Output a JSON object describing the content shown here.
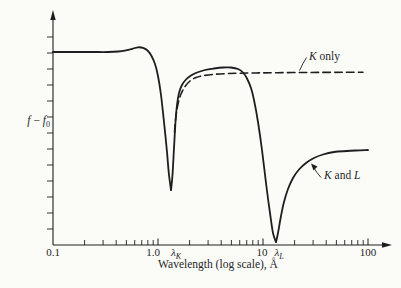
{
  "figure": {
    "background": "#fbfbf8",
    "line_color": "#1e1e1e",
    "text_color": "#262626"
  },
  "labels": {
    "y": {
      "f1": "f",
      "minus": " − ",
      "f2": "f",
      "sub": "0"
    },
    "lambda_k": {
      "main": "λ",
      "sub": "K"
    },
    "lambda_l": {
      "main": "λ",
      "sub": "L"
    }
  },
  "annotations": {
    "k_only": {
      "var": "K",
      "rest": " only"
    },
    "k_and_l": {
      "var1": "K",
      "mid": " and ",
      "var2": "L"
    }
  },
  "chart_data": {
    "type": "line",
    "title": "",
    "xlabel": "Wavelength (log scale), Å",
    "ylabel": "f − f₀",
    "x_scale": "log",
    "x_range_angstrom": [
      0.1,
      100
    ],
    "x_tick_labels": [
      "0.1",
      "1.0",
      "10",
      "100"
    ],
    "edge_labels": [
      "λK",
      "λL"
    ],
    "y_axis_numeric_labels": false,
    "grid": false,
    "legend_position": "inline-annotations",
    "coordinate_space": "svg_px (y-axis qualitative; x calibration: 0.1 Å at x0 px, decade_px per decade)",
    "axes": {
      "origin": [
        53,
        245
      ],
      "y_top": 18,
      "x_right": 384,
      "y_ticks": {
        "start": 37,
        "step": 16,
        "count": 13,
        "len": 6
      },
      "x_log": {
        "x0": 53,
        "decade_px": 105,
        "decades": 3,
        "minor_len": 5,
        "major_len": 6.5
      }
    },
    "series": [
      {
        "name": "K and L",
        "style": "solid",
        "width": 1.8,
        "segments": [
          [
            [
              53,
              52
            ],
            [
              72,
              52
            ],
            [
              92,
              52
            ],
            [
              108,
              52
            ],
            [
              118,
              51.5
            ],
            [
              126,
              50.3
            ],
            [
              133,
              48.6
            ],
            [
              138,
              47.3
            ],
            [
              143,
              47.8
            ],
            [
              147,
              50
            ],
            [
              151,
              55
            ],
            [
              155,
              64
            ],
            [
              158,
              76
            ],
            [
              161,
              95
            ],
            [
              164,
              122
            ],
            [
              167,
              152
            ],
            [
              169,
              175
            ],
            [
              171,
              190
            ]
          ],
          [
            [
              171,
              190
            ],
            [
              172.5,
              175
            ],
            [
              174,
              148
            ],
            [
              175.5,
              122
            ],
            [
              177,
              105
            ],
            [
              179,
              93
            ],
            [
              182,
              85
            ],
            [
              186,
              79.5
            ],
            [
              191,
              75.5
            ],
            [
              197,
              72.5
            ],
            [
              205,
              70
            ],
            [
              214,
              68.5
            ],
            [
              223,
              67.5
            ],
            [
              231,
              67.5
            ],
            [
              238,
              69
            ],
            [
              243,
              72.5
            ],
            [
              247,
              78.5
            ],
            [
              251,
              88
            ],
            [
              254,
              100
            ],
            [
              258,
              122
            ],
            [
              262,
              150
            ],
            [
              266,
              183
            ],
            [
              270,
              213
            ],
            [
              273,
              233
            ],
            [
              276,
              242
            ]
          ],
          [
            [
              276,
              242
            ],
            [
              278,
              233
            ],
            [
              281,
              216
            ],
            [
              284,
              202
            ],
            [
              288,
              189
            ],
            [
              293,
              178
            ],
            [
              299,
              169.5
            ],
            [
              306,
              163
            ],
            [
              314,
              158
            ],
            [
              323,
              154.5
            ],
            [
              334,
              152
            ],
            [
              347,
              151
            ],
            [
              360,
              150.3
            ],
            [
              368,
              150
            ]
          ]
        ]
      },
      {
        "name": "K only",
        "style": "dashed",
        "width": 1.6,
        "dash": "7.5 4.3",
        "segments": [
          [
            [
              174.5,
              132
            ],
            [
              176,
              116
            ],
            [
              178,
              104
            ],
            [
              181,
              94
            ],
            [
              185,
              86.5
            ],
            [
              190,
              81
            ],
            [
              196,
              77.5
            ],
            [
              204,
              75.5
            ],
            [
              214,
              74.3
            ],
            [
              226,
              73.6
            ],
            [
              240,
              73.2
            ],
            [
              258,
              72.9
            ],
            [
              278,
              72.7
            ],
            [
              300,
              72.5
            ],
            [
              322,
              72.4
            ],
            [
              344,
              72.3
            ],
            [
              363,
              72.2
            ]
          ]
        ]
      }
    ],
    "leaders": [
      {
        "name": "k-only-leader",
        "path": "M299.5,70.5 Q303,63 306.5,57.5"
      },
      {
        "name": "k-and-l-leader",
        "path": "M313,166.5 Q316.5,172.5 321,177.5",
        "arrow": "311,163.5 317.5,166.5 313.5,170.5"
      }
    ]
  }
}
